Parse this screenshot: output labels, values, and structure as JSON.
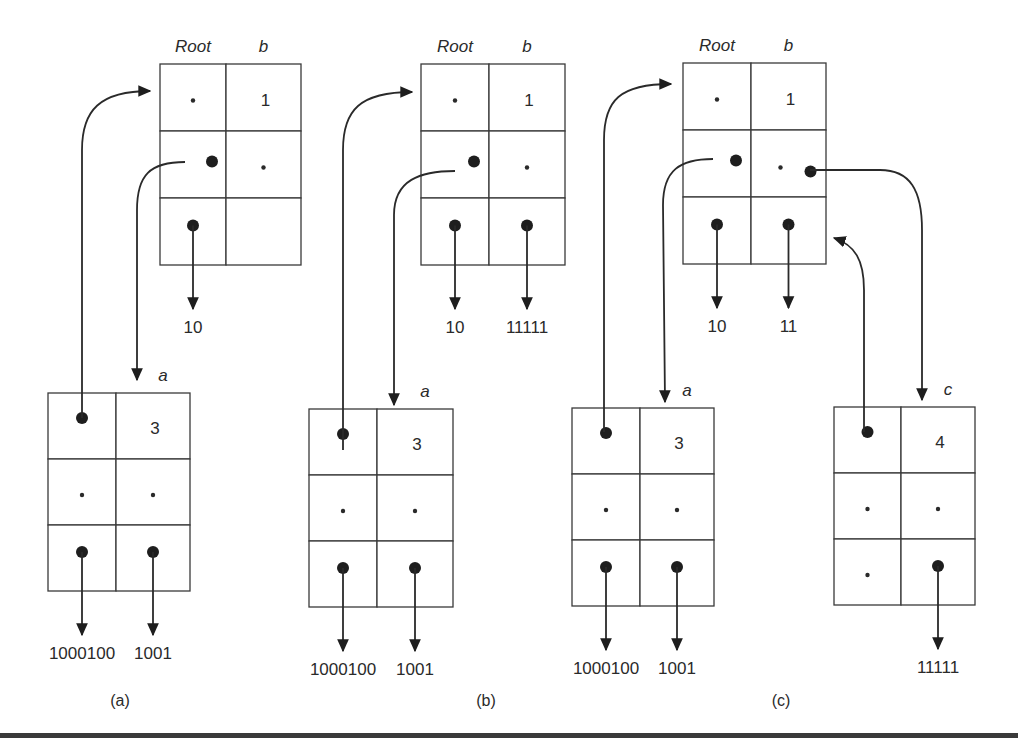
{
  "figure": {
    "panels": [
      {
        "id": "a",
        "caption": "(a)",
        "tables": [
          {
            "id": "root",
            "col_labels": [
              "Root",
              "b"
            ],
            "cells": [
              [
                {
                  "kind": "small-dot"
                },
                {
                  "kind": "text",
                  "text": "1"
                }
              ],
              [
                {
                  "kind": "pointer"
                },
                {
                  "kind": "small-dot"
                }
              ],
              [
                {
                  "kind": "pointer",
                  "points_to": "10"
                },
                {
                  "kind": "empty"
                }
              ]
            ],
            "outputs": [
              "10",
              ""
            ]
          },
          {
            "id": "a",
            "col_labels": [
              "",
              "a"
            ],
            "cells": [
              [
                {
                  "kind": "pointer"
                },
                {
                  "kind": "text",
                  "text": "3"
                }
              ],
              [
                {
                  "kind": "small-dot"
                },
                {
                  "kind": "small-dot"
                }
              ],
              [
                {
                  "kind": "pointer"
                },
                {
                  "kind": "pointer"
                }
              ]
            ],
            "outputs": [
              "1000100",
              "1001"
            ]
          }
        ],
        "links": [
          {
            "from": "a.cell[0][0]",
            "to": "root.cell[0][0]"
          },
          {
            "from": "root.cell[1][0]",
            "to": "a.label"
          }
        ]
      },
      {
        "id": "b",
        "caption": "(b)",
        "tables": [
          {
            "id": "root",
            "col_labels": [
              "Root",
              "b"
            ],
            "cells": [
              [
                {
                  "kind": "small-dot"
                },
                {
                  "kind": "text",
                  "text": "1"
                }
              ],
              [
                {
                  "kind": "pointer"
                },
                {
                  "kind": "small-dot"
                }
              ],
              [
                {
                  "kind": "pointer"
                },
                {
                  "kind": "pointer"
                }
              ]
            ],
            "outputs": [
              "10",
              "11111"
            ]
          },
          {
            "id": "a",
            "col_labels": [
              "",
              "a"
            ],
            "cells": [
              [
                {
                  "kind": "pointer"
                },
                {
                  "kind": "text",
                  "text": "3"
                }
              ],
              [
                {
                  "kind": "small-dot"
                },
                {
                  "kind": "small-dot"
                }
              ],
              [
                {
                  "kind": "pointer"
                },
                {
                  "kind": "pointer"
                }
              ]
            ],
            "outputs": [
              "1000100",
              "1001"
            ]
          }
        ],
        "links": [
          {
            "from": "a.cell[0][0]",
            "to": "root.cell[0][0]"
          },
          {
            "from": "root.cell[1][0]",
            "to": "a.cell[0][1]"
          }
        ]
      },
      {
        "id": "c",
        "caption": "(c)",
        "tables": [
          {
            "id": "root",
            "col_labels": [
              "Root",
              "b"
            ],
            "cells": [
              [
                {
                  "kind": "small-dot"
                },
                {
                  "kind": "text",
                  "text": "1"
                }
              ],
              [
                {
                  "kind": "pointer"
                },
                {
                  "kind": "small-dot+pointer"
                }
              ],
              [
                {
                  "kind": "pointer"
                },
                {
                  "kind": "pointer"
                }
              ]
            ],
            "outputs": [
              "10",
              "11"
            ]
          },
          {
            "id": "a",
            "col_labels": [
              "",
              "a"
            ],
            "cells": [
              [
                {
                  "kind": "pointer"
                },
                {
                  "kind": "text",
                  "text": "3"
                }
              ],
              [
                {
                  "kind": "small-dot"
                },
                {
                  "kind": "small-dot"
                }
              ],
              [
                {
                  "kind": "pointer"
                },
                {
                  "kind": "pointer"
                }
              ]
            ],
            "outputs": [
              "1000100",
              "1001"
            ]
          },
          {
            "id": "c",
            "col_labels": [
              "",
              "c"
            ],
            "cells": [
              [
                {
                  "kind": "pointer"
                },
                {
                  "kind": "text",
                  "text": "4"
                }
              ],
              [
                {
                  "kind": "small-dot"
                },
                {
                  "kind": "small-dot"
                }
              ],
              [
                {
                  "kind": "small-dot"
                },
                {
                  "kind": "pointer"
                }
              ]
            ],
            "outputs": [
              "",
              "11111"
            ]
          }
        ],
        "links": [
          {
            "from": "a.cell[0][0]",
            "to": "root.cell[0][0]"
          },
          {
            "from": "root.cell[1][0]",
            "to": "a.cell[0][1]"
          },
          {
            "from": "root.cell[1][1]",
            "to": "c.cell[0][1]"
          },
          {
            "from": "c.cell[0][0]",
            "to": "root.cell[2][1]"
          }
        ]
      }
    ]
  }
}
